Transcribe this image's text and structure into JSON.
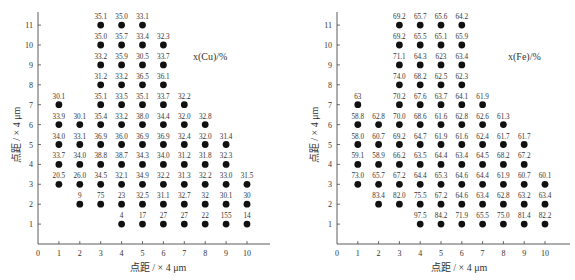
{
  "chart_data": [
    {
      "type": "scatter",
      "title": "x(Cu)/%",
      "xlabel": "点距 / × 4 μm",
      "ylabel": "点距 / × 4 μm",
      "xlim": [
        0,
        11
      ],
      "ylim": [
        0,
        11.5
      ],
      "xticks": [
        "0",
        "1",
        "2",
        "3",
        "4",
        "5",
        "6",
        "7",
        "8",
        "9",
        "10"
      ],
      "yticks": [
        "1",
        "2",
        "3",
        "4",
        "5",
        "6",
        "7",
        "8",
        "9",
        "10",
        "11"
      ],
      "grid": false,
      "points": [
        {
          "x": 3,
          "y": 11,
          "label": "35.1"
        },
        {
          "x": 4,
          "y": 11,
          "label": "35.0"
        },
        {
          "x": 5,
          "y": 11,
          "label": "33.1"
        },
        {
          "x": 3,
          "y": 10,
          "label": "35.0"
        },
        {
          "x": 4,
          "y": 10,
          "label": "35.7"
        },
        {
          "x": 5,
          "y": 10,
          "label": "33.4"
        },
        {
          "x": 6,
          "y": 10,
          "label": "32.3"
        },
        {
          "x": 3,
          "y": 9,
          "label": "33.2"
        },
        {
          "x": 4,
          "y": 9,
          "label": "35.9"
        },
        {
          "x": 5,
          "y": 9,
          "label": "30.5"
        },
        {
          "x": 6,
          "y": 9,
          "label": "33.7"
        },
        {
          "x": 3,
          "y": 8,
          "label": "31.2"
        },
        {
          "x": 4,
          "y": 8,
          "label": "33.2"
        },
        {
          "x": 5,
          "y": 8,
          "label": "36.5"
        },
        {
          "x": 6,
          "y": 8,
          "label": "36.1"
        },
        {
          "x": 1,
          "y": 7,
          "label": "30.1"
        },
        {
          "x": 3,
          "y": 7,
          "label": "35.1"
        },
        {
          "x": 4,
          "y": 7,
          "label": "33.5"
        },
        {
          "x": 5,
          "y": 7,
          "label": "35.1"
        },
        {
          "x": 6,
          "y": 7,
          "label": "33.7"
        },
        {
          "x": 7,
          "y": 7,
          "label": "32.2"
        },
        {
          "x": 1,
          "y": 6,
          "label": "33.9"
        },
        {
          "x": 2,
          "y": 6,
          "label": "30.1"
        },
        {
          "x": 3,
          "y": 6,
          "label": "35.4"
        },
        {
          "x": 4,
          "y": 6,
          "label": "33.2"
        },
        {
          "x": 5,
          "y": 6,
          "label": "38.0"
        },
        {
          "x": 6,
          "y": 6,
          "label": "34.4"
        },
        {
          "x": 7,
          "y": 6,
          "label": "32.0"
        },
        {
          "x": 8,
          "y": 6,
          "label": "32.8"
        },
        {
          "x": 1,
          "y": 5,
          "label": "34.0"
        },
        {
          "x": 2,
          "y": 5,
          "label": "33.1"
        },
        {
          "x": 3,
          "y": 5,
          "label": "36.9"
        },
        {
          "x": 4,
          "y": 5,
          "label": "36.0"
        },
        {
          "x": 5,
          "y": 5,
          "label": "36.9"
        },
        {
          "x": 6,
          "y": 5,
          "label": "36.9"
        },
        {
          "x": 7,
          "y": 5,
          "label": "32.4"
        },
        {
          "x": 8,
          "y": 5,
          "label": "32.0"
        },
        {
          "x": 9,
          "y": 5,
          "label": "31.4"
        },
        {
          "x": 1,
          "y": 4,
          "label": "33.7"
        },
        {
          "x": 2,
          "y": 4,
          "label": "34.0"
        },
        {
          "x": 3,
          "y": 4,
          "label": "38.8"
        },
        {
          "x": 4,
          "y": 4,
          "label": "38.7"
        },
        {
          "x": 5,
          "y": 4,
          "label": "34.3"
        },
        {
          "x": 6,
          "y": 4,
          "label": "34.0"
        },
        {
          "x": 7,
          "y": 4,
          "label": "31.2"
        },
        {
          "x": 8,
          "y": 4,
          "label": "31.8"
        },
        {
          "x": 9,
          "y": 4,
          "label": "32.3"
        },
        {
          "x": 1,
          "y": 3,
          "label": "20.5"
        },
        {
          "x": 2,
          "y": 3,
          "label": "26.0"
        },
        {
          "x": 3,
          "y": 3,
          "label": "34.5"
        },
        {
          "x": 4,
          "y": 3,
          "label": "32.1"
        },
        {
          "x": 5,
          "y": 3,
          "label": "34.9"
        },
        {
          "x": 6,
          "y": 3,
          "label": "32.2"
        },
        {
          "x": 7,
          "y": 3,
          "label": "31.3"
        },
        {
          "x": 8,
          "y": 3,
          "label": "32.2"
        },
        {
          "x": 9,
          "y": 3,
          "label": "33.0"
        },
        {
          "x": 10,
          "y": 3,
          "label": "31.5"
        },
        {
          "x": 2,
          "y": 2,
          "label": "9"
        },
        {
          "x": 3,
          "y": 2,
          "label": "75"
        },
        {
          "x": 4,
          "y": 2,
          "label": "23"
        },
        {
          "x": 5,
          "y": 2,
          "label": "32.5"
        },
        {
          "x": 6,
          "y": 2,
          "label": "31.1"
        },
        {
          "x": 7,
          "y": 2,
          "label": "32.7"
        },
        {
          "x": 8,
          "y": 2,
          "label": "32"
        },
        {
          "x": 9,
          "y": 2,
          "label": "30.1"
        },
        {
          "x": 10,
          "y": 2,
          "label": "30"
        },
        {
          "x": 4,
          "y": 1,
          "label": "4"
        },
        {
          "x": 5,
          "y": 1,
          "label": "17"
        },
        {
          "x": 6,
          "y": 1,
          "label": "27"
        },
        {
          "x": 7,
          "y": 1,
          "label": "27"
        },
        {
          "x": 8,
          "y": 1,
          "label": "22"
        },
        {
          "x": 9,
          "y": 1,
          "label": "155"
        },
        {
          "x": 10,
          "y": 1,
          "label": "14"
        }
      ]
    },
    {
      "type": "scatter",
      "title": "x(Fe)/%",
      "xlabel": "点距 / × 4 μm",
      "ylabel": "点距 / × 4 μm",
      "xlim": [
        0,
        11
      ],
      "ylim": [
        0,
        11.5
      ],
      "xticks": [
        "0",
        "1",
        "2",
        "3",
        "4",
        "5",
        "6",
        "7",
        "8",
        "9",
        "10"
      ],
      "yticks": [
        "1",
        "2",
        "3",
        "4",
        "5",
        "6",
        "7",
        "8",
        "9",
        "10",
        "11"
      ],
      "grid": false,
      "points": [
        {
          "x": 3,
          "y": 11,
          "label": "69.2"
        },
        {
          "x": 4,
          "y": 11,
          "label": "65.7"
        },
        {
          "x": 5,
          "y": 11,
          "label": "65.6"
        },
        {
          "x": 6,
          "y": 11,
          "label": "64.2"
        },
        {
          "x": 3,
          "y": 10,
          "label": "69.2"
        },
        {
          "x": 4,
          "y": 10,
          "label": "65.5"
        },
        {
          "x": 5,
          "y": 10,
          "label": "65.1"
        },
        {
          "x": 6,
          "y": 10,
          "label": "65.9"
        },
        {
          "x": 3,
          "y": 9,
          "label": "71.1"
        },
        {
          "x": 4,
          "y": 9,
          "label": "64.3"
        },
        {
          "x": 5,
          "y": 9,
          "label": "623"
        },
        {
          "x": 6,
          "y": 9,
          "label": "63.4"
        },
        {
          "x": 3,
          "y": 8,
          "label": "74.0"
        },
        {
          "x": 4,
          "y": 8,
          "label": "68.2"
        },
        {
          "x": 5,
          "y": 8,
          "label": "62.5"
        },
        {
          "x": 6,
          "y": 8,
          "label": "62.3"
        },
        {
          "x": 1,
          "y": 7,
          "label": "63"
        },
        {
          "x": 3,
          "y": 7,
          "label": "70.2"
        },
        {
          "x": 4,
          "y": 7,
          "label": "67.6"
        },
        {
          "x": 5,
          "y": 7,
          "label": "63.7"
        },
        {
          "x": 6,
          "y": 7,
          "label": "64.1"
        },
        {
          "x": 7,
          "y": 7,
          "label": "61.9"
        },
        {
          "x": 1,
          "y": 6,
          "label": "58.8"
        },
        {
          "x": 2,
          "y": 6,
          "label": "62.8"
        },
        {
          "x": 3,
          "y": 6,
          "label": "70.0"
        },
        {
          "x": 4,
          "y": 6,
          "label": "68.6"
        },
        {
          "x": 5,
          "y": 6,
          "label": "61.6"
        },
        {
          "x": 6,
          "y": 6,
          "label": "62.8"
        },
        {
          "x": 7,
          "y": 6,
          "label": "62.6"
        },
        {
          "x": 8,
          "y": 6,
          "label": "61.3"
        },
        {
          "x": 1,
          "y": 5,
          "label": "58.0"
        },
        {
          "x": 2,
          "y": 5,
          "label": "60.7"
        },
        {
          "x": 3,
          "y": 5,
          "label": "69.2"
        },
        {
          "x": 4,
          "y": 5,
          "label": "64.7"
        },
        {
          "x": 5,
          "y": 5,
          "label": "61.9"
        },
        {
          "x": 6,
          "y": 5,
          "label": "61.6"
        },
        {
          "x": 7,
          "y": 5,
          "label": "62.4"
        },
        {
          "x": 8,
          "y": 5,
          "label": "61.7"
        },
        {
          "x": 9,
          "y": 5,
          "label": "61.7"
        },
        {
          "x": 1,
          "y": 4,
          "label": "59.1"
        },
        {
          "x": 2,
          "y": 4,
          "label": "58.9"
        },
        {
          "x": 3,
          "y": 4,
          "label": "66.2"
        },
        {
          "x": 4,
          "y": 4,
          "label": "63.5"
        },
        {
          "x": 5,
          "y": 4,
          "label": "64.4"
        },
        {
          "x": 6,
          "y": 4,
          "label": "63.4"
        },
        {
          "x": 7,
          "y": 4,
          "label": "64.5"
        },
        {
          "x": 8,
          "y": 4,
          "label": "68.2"
        },
        {
          "x": 9,
          "y": 4,
          "label": "67.2"
        },
        {
          "x": 1,
          "y": 3,
          "label": "73.0"
        },
        {
          "x": 2,
          "y": 3,
          "label": "65.7"
        },
        {
          "x": 3,
          "y": 3,
          "label": "67.2"
        },
        {
          "x": 4,
          "y": 3,
          "label": "64.4"
        },
        {
          "x": 5,
          "y": 3,
          "label": "65.3"
        },
        {
          "x": 6,
          "y": 3,
          "label": "64.6"
        },
        {
          "x": 7,
          "y": 3,
          "label": "64.4"
        },
        {
          "x": 8,
          "y": 3,
          "label": "61.9"
        },
        {
          "x": 9,
          "y": 3,
          "label": "60.7"
        },
        {
          "x": 10,
          "y": 3,
          "label": "60.1"
        },
        {
          "x": 2,
          "y": 2,
          "label": "83.4"
        },
        {
          "x": 3,
          "y": 2,
          "label": "82.0"
        },
        {
          "x": 4,
          "y": 2,
          "label": "75.5"
        },
        {
          "x": 5,
          "y": 2,
          "label": "67.2"
        },
        {
          "x": 6,
          "y": 2,
          "label": "64.6"
        },
        {
          "x": 7,
          "y": 2,
          "label": "63.4"
        },
        {
          "x": 8,
          "y": 2,
          "label": "62.8"
        },
        {
          "x": 9,
          "y": 2,
          "label": "63.2"
        },
        {
          "x": 10,
          "y": 2,
          "label": "63.4"
        },
        {
          "x": 4,
          "y": 1,
          "label": "97.5"
        },
        {
          "x": 5,
          "y": 1,
          "label": "84.2"
        },
        {
          "x": 6,
          "y": 1,
          "label": "71.9"
        },
        {
          "x": 7,
          "y": 1,
          "label": "65.5"
        },
        {
          "x": 8,
          "y": 1,
          "label": "75.0"
        },
        {
          "x": 9,
          "y": 1,
          "label": "81.4"
        },
        {
          "x": 10,
          "y": 1,
          "label": "82.2"
        }
      ]
    }
  ],
  "charts": {
    "left": {
      "title": "x(Cu)/%",
      "xlabel": "点距 / × 4 μm",
      "ylabel": "点距 / × 4 μm"
    },
    "right": {
      "title": "x(Fe)/%",
      "xlabel": "点距 / × 4 μm",
      "ylabel": "点距 / × 4 μm"
    }
  },
  "colors": {
    "marker": "#111111",
    "axis": "#333333",
    "text": "#333333"
  }
}
